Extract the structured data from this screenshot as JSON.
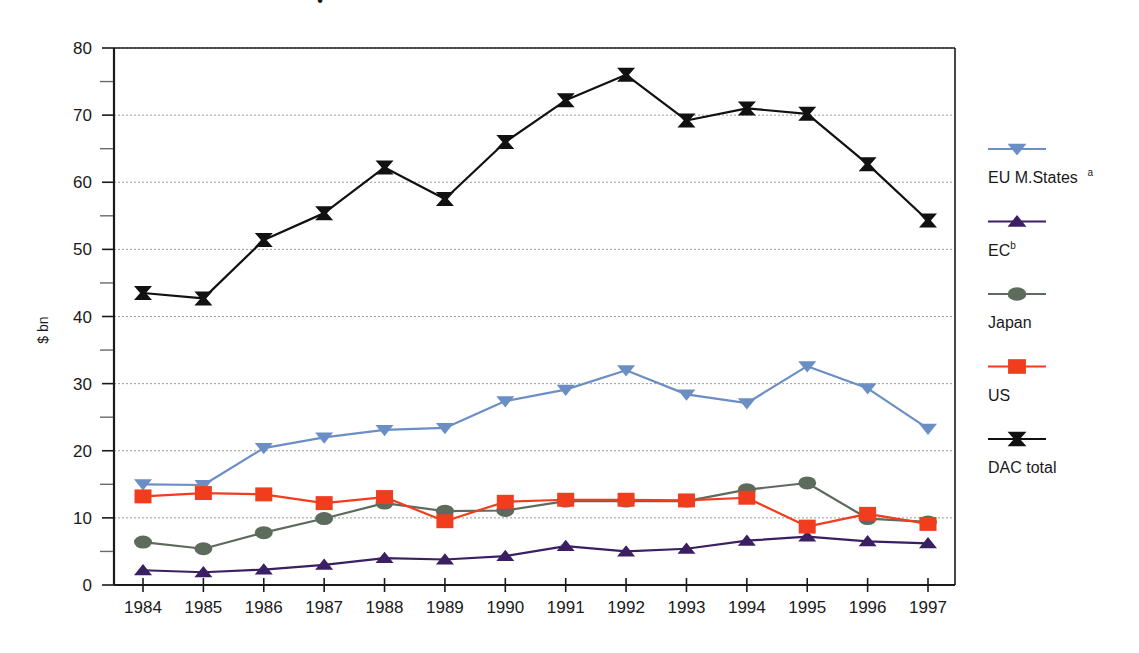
{
  "figure": {
    "title_fragment": "•",
    "background": "#ffffff"
  },
  "axes": {
    "y_title": "$ bn",
    "y_ticks": [
      "0",
      "10",
      "20",
      "30",
      "40",
      "50",
      "60",
      "70",
      "80"
    ],
    "y_minor_ticks": [
      "5",
      "15",
      "25",
      "35",
      "45",
      "55",
      "65",
      "75"
    ],
    "x_ticks": [
      "1984",
      "1985",
      "1986",
      "1987",
      "1988",
      "1989",
      "1990",
      "1991",
      "1992",
      "1993",
      "1994",
      "1995",
      "1996",
      "1997"
    ]
  },
  "legend": {
    "position": "right",
    "items": [
      {
        "label": "EU M.States",
        "superscript": "a",
        "color": "#6b8ec4",
        "marker": "triangle-down",
        "name": "eu-m-states"
      },
      {
        "label": "EC",
        "superscript": "b",
        "color": "#3b1f63",
        "marker": "triangle-up",
        "name": "ec"
      },
      {
        "label": "Japan",
        "superscript": "",
        "color": "#5d6b5d",
        "marker": "ellipse",
        "name": "japan"
      },
      {
        "label": "US",
        "superscript": "",
        "color": "#f23c1e",
        "marker": "square",
        "name": "us"
      },
      {
        "label": "DAC total",
        "superscript": "",
        "color": "#111111",
        "marker": "bowtie",
        "name": "dac-total"
      }
    ]
  },
  "chart_data": {
    "type": "line",
    "title": "",
    "xlabel": "",
    "ylabel": "$ bn",
    "ylim": [
      0,
      80
    ],
    "grid": true,
    "legend_position": "right",
    "categories": [
      "1984",
      "1985",
      "1986",
      "1987",
      "1988",
      "1989",
      "1990",
      "1991",
      "1992",
      "1993",
      "1994",
      "1995",
      "1996",
      "1997"
    ],
    "series": [
      {
        "name": "EU M.States",
        "color": "#6b8ec4",
        "marker": "triangle-down",
        "values": [
          15.0,
          14.9,
          20.4,
          22.0,
          23.1,
          23.4,
          27.4,
          29.1,
          32.0,
          28.4,
          27.1,
          32.6,
          29.3,
          23.3
        ]
      },
      {
        "name": "EC",
        "color": "#3b1f63",
        "marker": "triangle-up",
        "values": [
          2.2,
          1.9,
          2.3,
          3.0,
          4.0,
          3.8,
          4.3,
          5.8,
          5.0,
          5.4,
          6.6,
          7.2,
          6.5,
          6.2
        ]
      },
      {
        "name": "Japan",
        "color": "#5d6b5d",
        "marker": "ellipse",
        "values": [
          6.4,
          5.4,
          7.8,
          9.9,
          12.2,
          11.0,
          11.1,
          12.5,
          12.5,
          12.5,
          14.2,
          15.2,
          9.9,
          9.4
        ]
      },
      {
        "name": "US",
        "color": "#f23c1e",
        "marker": "square",
        "values": [
          13.2,
          13.7,
          13.5,
          12.2,
          13.1,
          9.5,
          12.4,
          12.7,
          12.7,
          12.6,
          13.0,
          8.7,
          10.6,
          9.1
        ]
      },
      {
        "name": "DAC total",
        "color": "#111111",
        "marker": "bowtie",
        "values": [
          43.5,
          42.7,
          51.4,
          55.4,
          62.2,
          57.5,
          66.0,
          72.2,
          76.0,
          69.2,
          71.0,
          70.2,
          62.7,
          54.3
        ]
      }
    ]
  }
}
